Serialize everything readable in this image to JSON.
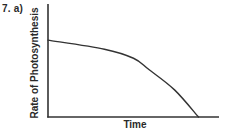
{
  "question": {
    "label": "7. a)"
  },
  "chart_data": {
    "type": "line",
    "title": "",
    "xlabel": "Time",
    "ylabel": "Rate of Photosynthesis",
    "xlim": [
      0,
      10
    ],
    "ylim": [
      0,
      10
    ],
    "grid": false,
    "legend": null,
    "ticks": false,
    "series": [
      {
        "name": "rate",
        "description": "Concave-down decreasing curve: starts high at time 0 and falls increasingly steeply to zero",
        "x": [
          0,
          3.3,
          5.0,
          5.9,
          7.4,
          8.8
        ],
        "y": [
          6.8,
          6.0,
          5.2,
          4.2,
          2.4,
          0
        ]
      }
    ],
    "colors": {
      "axis": "#333333",
      "line": "#333333"
    }
  }
}
